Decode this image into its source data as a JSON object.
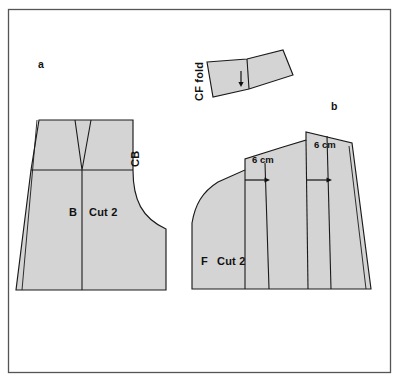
{
  "figure": {
    "kind": "sewing-pattern-diagram",
    "background_color": "#ffffff",
    "frame_color": "#555555",
    "piece_fill_color": "#d4d4d4",
    "line_color": "#1a1a1a"
  },
  "figure_labels": [
    {
      "id": "a",
      "text": "a",
      "x": 41,
      "y": 67
    },
    {
      "id": "b",
      "text": "b",
      "x": 333,
      "y": 108
    }
  ],
  "pieces": [
    {
      "id": "back-piece",
      "name": "Back bodice pattern piece",
      "letter": "B",
      "cut_instruction": "Cut 2",
      "grain_label": "CB",
      "grain_label_rotation": -90,
      "notes": "Has a V-shaped dart at top centre and a curved armhole-style cut-out on the right"
    },
    {
      "id": "front-piece",
      "name": "Front bodice pattern piece",
      "letter": "F",
      "cut_instruction": "Cut 2",
      "notes": "Shown slashed and spread with two 6 cm expansions"
    },
    {
      "id": "cf-fold-piece",
      "name": "Centre front fold facing piece",
      "fold_label": "CF fold",
      "fold_label_rotation": -90,
      "notes": "Small wedge-shaped piece with vertical slash line and arrow"
    }
  ],
  "measurements": [
    {
      "id": "spread-1",
      "value": "6 cm",
      "x": 264,
      "y": 161,
      "direction": "right"
    },
    {
      "id": "spread-2",
      "value": "6 cm",
      "x": 330,
      "y": 146,
      "direction": "right"
    }
  ],
  "text_labels": {
    "back_letter": "B",
    "back_cut": "Cut 2",
    "back_cb": "CB",
    "front_letter": "F",
    "front_cut": "Cut 2",
    "cf_fold": "CF fold",
    "fig_a": "a",
    "fig_b": "b",
    "measure_1": "6 cm",
    "measure_2": "6 cm"
  }
}
